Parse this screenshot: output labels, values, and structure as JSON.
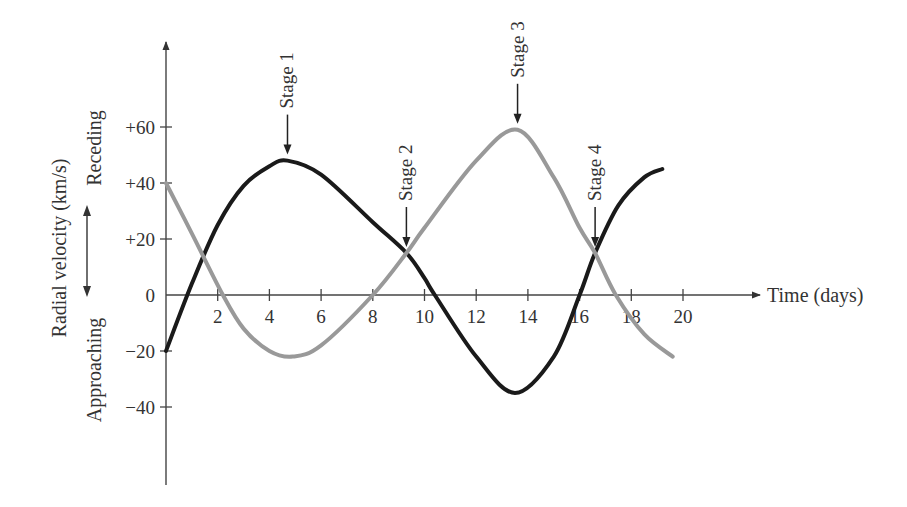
{
  "chart_data": {
    "type": "line",
    "title": "",
    "xlabel": "Time (days)",
    "ylabel": "Radial velocity (km/s)",
    "ylabel_direction_up": "Receding",
    "ylabel_direction_down": "Approaching",
    "xlim": [
      0,
      20
    ],
    "ylim": [
      -60,
      80
    ],
    "x_ticks": [
      2,
      4,
      6,
      8,
      10,
      12,
      14,
      16,
      18,
      20
    ],
    "x_tick_labels": [
      "2",
      "4",
      "6",
      "8",
      "10",
      "12",
      "14",
      "16",
      "18",
      "20"
    ],
    "y_ticks": [
      60,
      40,
      20,
      0,
      -20,
      -40
    ],
    "y_tick_labels": [
      "+60",
      "+40",
      "+20",
      "0",
      "−20",
      "−40"
    ],
    "grid": false,
    "legend": null,
    "series": [
      {
        "name": "Star A (dark curve)",
        "color": "#1a1a1a",
        "x": [
          0,
          1,
          2,
          3,
          4,
          4.7,
          6,
          8,
          9.3,
          10,
          10.4,
          12,
          13.5,
          15,
          16,
          16.6,
          17.5,
          18.5,
          19.2
        ],
        "values": [
          -20,
          4,
          25,
          39,
          46,
          48,
          43,
          26,
          15,
          6,
          0,
          -22,
          -35,
          -22,
          0,
          15,
          32,
          42,
          45
        ]
      },
      {
        "name": "Star B (gray curve)",
        "color": "#999999",
        "x": [
          0,
          1,
          2.2,
          3,
          4,
          4.9,
          6,
          8,
          9.3,
          10,
          12,
          13.6,
          15,
          16,
          16.6,
          17.4,
          18.5,
          19.6
        ],
        "values": [
          40,
          22,
          0,
          -12,
          -20,
          -22,
          -18,
          0,
          15,
          24,
          48,
          59,
          42,
          24,
          15,
          0,
          -14,
          -22
        ]
      }
    ],
    "annotations": [
      {
        "label": "Stage 1",
        "x": 4.7,
        "y": 48,
        "note": "dark curve at maximum recession"
      },
      {
        "label": "Stage 2",
        "x": 9.3,
        "y": 15,
        "note": "curves cross"
      },
      {
        "label": "Stage 3",
        "x": 13.6,
        "y": 59,
        "note": "gray curve at maximum recession"
      },
      {
        "label": "Stage 4",
        "x": 16.6,
        "y": 15,
        "note": "curves cross"
      }
    ]
  }
}
